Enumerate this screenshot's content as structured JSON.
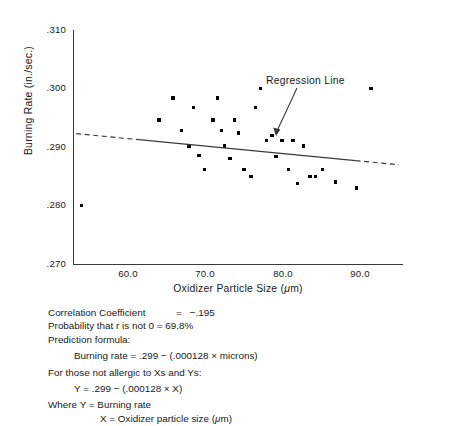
{
  "figure": {
    "title_hidden": "",
    "annotation": {
      "regression_label": "Regression Line"
    }
  },
  "axes": {
    "y_title": "Burning Rate (in./sec.)",
    "x_title_main": "Oxidizer Particle Size (",
    "x_title_unit": "μ",
    "x_title_close": "m)",
    "y_ticks": [
      ".310",
      ".300",
      ".290",
      ".280",
      ".270"
    ],
    "x_ticks": [
      "60.0",
      "70.0",
      "80.0",
      "90.0"
    ]
  },
  "stats": {
    "correlation_label": "Correlation Coefficient",
    "correlation_eq": "=",
    "correlation_value": "−.195",
    "probability_line": "Probability that r is not 0  =  69.8%",
    "prediction_header": "Prediction formula:",
    "prediction_formula": "Burning rate  =  .299  −  (.000128  ×  microns)",
    "allergic_line": "For those not allergic to Xs and Ys:",
    "xy_formula": "Y  =  .299  −  (.000128  ×  X)",
    "where_y": "Where Y  =  Burning rate",
    "where_x_pre": "X  =  Oxidizer particle size (",
    "where_x_unit": "μ",
    "where_x_post": "m)"
  },
  "chart_data": {
    "type": "scatter",
    "title": "",
    "xlabel": "Oxidizer Particle Size (μm)",
    "ylabel": "Burning Rate (in./sec.)",
    "xlim": [
      52.0,
      94.5
    ],
    "ylim": [
      0.27,
      0.31
    ],
    "xticks": [
      60.0,
      70.0,
      80.0,
      90.0
    ],
    "yticks": [
      0.27,
      0.28,
      0.29,
      0.3,
      0.31
    ],
    "grid": false,
    "legend": false,
    "points": [
      {
        "x": 53.1,
        "y": 0.28
      },
      {
        "x": 63.1,
        "y": 0.2946
      },
      {
        "x": 64.9,
        "y": 0.2984
      },
      {
        "x": 66.0,
        "y": 0.2928
      },
      {
        "x": 67.0,
        "y": 0.2902
      },
      {
        "x": 67.6,
        "y": 0.2968
      },
      {
        "x": 68.3,
        "y": 0.2885
      },
      {
        "x": 69.0,
        "y": 0.2862
      },
      {
        "x": 70.1,
        "y": 0.2946
      },
      {
        "x": 70.7,
        "y": 0.2984
      },
      {
        "x": 71.2,
        "y": 0.2928
      },
      {
        "x": 71.6,
        "y": 0.2902
      },
      {
        "x": 72.3,
        "y": 0.288
      },
      {
        "x": 72.9,
        "y": 0.2946
      },
      {
        "x": 73.4,
        "y": 0.2924
      },
      {
        "x": 74.1,
        "y": 0.2862
      },
      {
        "x": 75.0,
        "y": 0.285
      },
      {
        "x": 75.6,
        "y": 0.2968
      },
      {
        "x": 76.2,
        "y": 0.3
      },
      {
        "x": 77.0,
        "y": 0.2911
      },
      {
        "x": 77.7,
        "y": 0.292
      },
      {
        "x": 78.2,
        "y": 0.2884
      },
      {
        "x": 79.0,
        "y": 0.2911
      },
      {
        "x": 79.8,
        "y": 0.2862
      },
      {
        "x": 80.4,
        "y": 0.2911
      },
      {
        "x": 81.0,
        "y": 0.2838
      },
      {
        "x": 81.8,
        "y": 0.2902
      },
      {
        "x": 82.6,
        "y": 0.285
      },
      {
        "x": 83.3,
        "y": 0.285
      },
      {
        "x": 84.2,
        "y": 0.2862
      },
      {
        "x": 85.9,
        "y": 0.284
      },
      {
        "x": 88.6,
        "y": 0.283
      },
      {
        "x": 90.5,
        "y": 0.3
      }
    ],
    "regression": {
      "slope": -0.000128,
      "intercept": 0.299,
      "equation": "Y = .299 - (.000128 x X)",
      "correlation_coefficient": -0.195,
      "probability_r_not_zero": 69.8,
      "solid_x_range": [
        60.5,
        88.5
      ],
      "dashed": true
    }
  }
}
